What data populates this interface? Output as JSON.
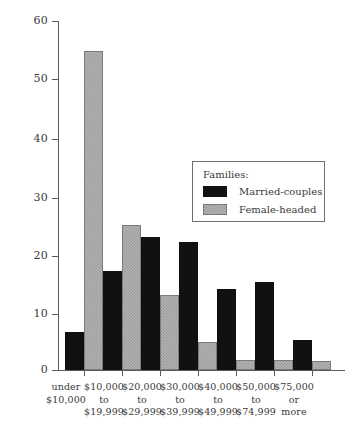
{
  "chart_data": {
    "type": "bar",
    "title": "",
    "subtitle": "",
    "xlabel": "",
    "ylabel": "",
    "ylim": [
      0,
      60
    ],
    "yticks": [
      0,
      10,
      20,
      30,
      40,
      50,
      60
    ],
    "ytick_labels": [
      "0",
      "10",
      "20",
      "30",
      "40",
      "50",
      "60"
    ],
    "grid": false,
    "legend_position": "inside-upper-right",
    "legend_title": "Families:",
    "categories": [
      "under $10,000",
      "$10,000 to $19,999",
      "$20,000 to $29,999",
      "$30,000 to $39,999",
      "$40,000 to $49,999",
      "$50,000 to $74,999",
      "$75,000 or more"
    ],
    "category_label_lines": [
      [
        "under",
        "$10,000"
      ],
      [
        "$10,000",
        "to",
        "$19,999"
      ],
      [
        "$20,000",
        "to",
        "$29,999"
      ],
      [
        "$30,000",
        "to",
        "$39,999"
      ],
      [
        "$40,000",
        "to",
        "$49,999"
      ],
      [
        "$50,000",
        "to",
        "$74,999"
      ],
      [
        "$75,000",
        "or",
        "more"
      ]
    ],
    "series": [
      {
        "name": "Married-couples",
        "color": "#111111",
        "values": [
          6.5,
          17,
          23,
          22,
          14,
          15.2,
          5.2
        ]
      },
      {
        "name": "Female-headed",
        "color": "#b2b2b2",
        "values": [
          55,
          25,
          13,
          4.8,
          1.8,
          1.8,
          1.5
        ]
      }
    ]
  },
  "legend": {
    "title": "Families:",
    "entries": [
      {
        "label": "Married-couples",
        "swatch": "black"
      },
      {
        "label": "Female-headed",
        "swatch": "gray"
      }
    ]
  },
  "axis": {
    "y_labels": [
      "60",
      "50",
      "40",
      "30",
      "20",
      "10",
      "0"
    ]
  },
  "xaxis": {
    "labels": [
      {
        "l1": "under",
        "l2": "$10,000",
        "l3": ""
      },
      {
        "l1": "$10,000",
        "l2": "to",
        "l3": "$19,999"
      },
      {
        "l1": "$20,000",
        "l2": "to",
        "l3": "$29,999"
      },
      {
        "l1": "$30,000",
        "l2": "to",
        "l3": "$39,999"
      },
      {
        "l1": "$40,000",
        "l2": "to",
        "l3": "$49,999"
      },
      {
        "l1": "$50,000",
        "l2": "to",
        "l3": "$74,999"
      },
      {
        "l1": "$75,000",
        "l2": "or",
        "l3": "more"
      }
    ]
  }
}
